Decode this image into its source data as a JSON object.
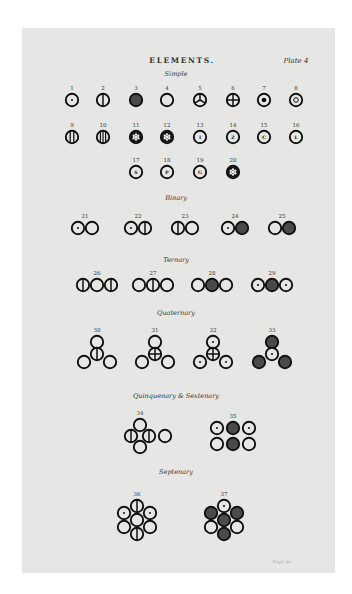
{
  "header": {
    "title": "ELEMENTS.",
    "plate": "Plate 4"
  },
  "sections": [
    {
      "id": "simple",
      "label": "Simple",
      "x": 176,
      "y": 76
    },
    {
      "id": "binary",
      "label": "Binary",
      "x": 176,
      "y": 200
    },
    {
      "id": "ternary",
      "label": "Ternary",
      "x": 176,
      "y": 262
    },
    {
      "id": "quaternary",
      "label": "Quaternary",
      "x": 176,
      "y": 315
    },
    {
      "id": "quinquenary-sextenary",
      "label": "Quinquenary & Sextenary",
      "x": 176,
      "y": 398
    },
    {
      "id": "septenary",
      "label": "Septenary",
      "x": 176,
      "y": 474
    }
  ],
  "signature": "Engd. &c",
  "colors": {
    "ink": "#111111",
    "fill_dark": "#4a4a4a",
    "paper": "#e6e6e4"
  },
  "symbols": [
    {
      "n": "1",
      "x": 72,
      "y": 100,
      "atoms": [
        {
          "dx": 0,
          "dy": 0,
          "t": "dot"
        }
      ]
    },
    {
      "n": "2",
      "x": 103,
      "y": 100,
      "atoms": [
        {
          "dx": 0,
          "dy": 0,
          "t": "vline"
        }
      ]
    },
    {
      "n": "3",
      "x": 136,
      "y": 100,
      "atoms": [
        {
          "dx": 0,
          "dy": 0,
          "t": "filled"
        }
      ]
    },
    {
      "n": "4",
      "x": 167,
      "y": 100,
      "atoms": [
        {
          "dx": 0,
          "dy": 0,
          "t": "plain"
        }
      ]
    },
    {
      "n": "5",
      "x": 200,
      "y": 100,
      "atoms": [
        {
          "dx": 0,
          "dy": 0,
          "t": "trisect"
        }
      ]
    },
    {
      "n": "6",
      "x": 233,
      "y": 100,
      "atoms": [
        {
          "dx": 0,
          "dy": 0,
          "t": "cross"
        }
      ]
    },
    {
      "n": "7",
      "x": 264,
      "y": 100,
      "atoms": [
        {
          "dx": 0,
          "dy": 0,
          "t": "bigdot"
        }
      ]
    },
    {
      "n": "8",
      "x": 296,
      "y": 100,
      "atoms": [
        {
          "dx": 0,
          "dy": 0,
          "t": "ring"
        }
      ]
    },
    {
      "n": "9",
      "x": 72,
      "y": 137,
      "atoms": [
        {
          "dx": 0,
          "dy": 0,
          "t": "vline2"
        }
      ]
    },
    {
      "n": "10",
      "x": 103,
      "y": 137,
      "atoms": [
        {
          "dx": 0,
          "dy": 0,
          "t": "vline3"
        }
      ]
    },
    {
      "n": "11",
      "x": 136,
      "y": 137,
      "atoms": [
        {
          "dx": 0,
          "dy": 0,
          "t": "star"
        }
      ]
    },
    {
      "n": "12",
      "x": 167,
      "y": 137,
      "atoms": [
        {
          "dx": 0,
          "dy": 0,
          "t": "star"
        }
      ]
    },
    {
      "n": "13",
      "x": 200,
      "y": 137,
      "atoms": [
        {
          "dx": 0,
          "dy": 0,
          "t": "letter",
          "l": "I"
        }
      ]
    },
    {
      "n": "14",
      "x": 233,
      "y": 137,
      "atoms": [
        {
          "dx": 0,
          "dy": 0,
          "t": "letter",
          "l": "Z"
        }
      ]
    },
    {
      "n": "15",
      "x": 264,
      "y": 137,
      "atoms": [
        {
          "dx": 0,
          "dy": 0,
          "t": "letter",
          "l": "C"
        }
      ]
    },
    {
      "n": "16",
      "x": 296,
      "y": 137,
      "atoms": [
        {
          "dx": 0,
          "dy": 0,
          "t": "letter",
          "l": "L"
        }
      ]
    },
    {
      "n": "17",
      "x": 136,
      "y": 172,
      "atoms": [
        {
          "dx": 0,
          "dy": 0,
          "t": "letter",
          "l": "S"
        }
      ]
    },
    {
      "n": "18",
      "x": 167,
      "y": 172,
      "atoms": [
        {
          "dx": 0,
          "dy": 0,
          "t": "letter",
          "l": "P"
        }
      ]
    },
    {
      "n": "19",
      "x": 200,
      "y": 172,
      "atoms": [
        {
          "dx": 0,
          "dy": 0,
          "t": "letter",
          "l": "G"
        }
      ]
    },
    {
      "n": "20",
      "x": 233,
      "y": 172,
      "atoms": [
        {
          "dx": 0,
          "dy": 0,
          "t": "star"
        }
      ]
    },
    {
      "n": "21",
      "x": 85,
      "y": 228,
      "atoms": [
        {
          "dx": -7,
          "dy": 0,
          "t": "dot"
        },
        {
          "dx": 7,
          "dy": 0,
          "t": "plain"
        }
      ]
    },
    {
      "n": "22",
      "x": 138,
      "y": 228,
      "atoms": [
        {
          "dx": -7,
          "dy": 0,
          "t": "dot"
        },
        {
          "dx": 7,
          "dy": 0,
          "t": "vline"
        }
      ]
    },
    {
      "n": "23",
      "x": 185,
      "y": 228,
      "atoms": [
        {
          "dx": -7,
          "dy": 0,
          "t": "vline"
        },
        {
          "dx": 7,
          "dy": 0,
          "t": "plain"
        }
      ]
    },
    {
      "n": "24",
      "x": 235,
      "y": 228,
      "atoms": [
        {
          "dx": -7,
          "dy": 0,
          "t": "dot"
        },
        {
          "dx": 7,
          "dy": 0,
          "t": "filled"
        }
      ]
    },
    {
      "n": "25",
      "x": 282,
      "y": 228,
      "atoms": [
        {
          "dx": -7,
          "dy": 0,
          "t": "plain"
        },
        {
          "dx": 7,
          "dy": 0,
          "t": "filled"
        }
      ]
    },
    {
      "n": "26",
      "x": 97,
      "y": 285,
      "atoms": [
        {
          "dx": -14,
          "dy": 0,
          "t": "vline"
        },
        {
          "dx": 0,
          "dy": 0,
          "t": "plain"
        },
        {
          "dx": 14,
          "dy": 0,
          "t": "vline"
        }
      ]
    },
    {
      "n": "27",
      "x": 153,
      "y": 285,
      "atoms": [
        {
          "dx": -14,
          "dy": 0,
          "t": "plain"
        },
        {
          "dx": 0,
          "dy": 0,
          "t": "vline"
        },
        {
          "dx": 14,
          "dy": 0,
          "t": "plain"
        }
      ]
    },
    {
      "n": "28",
      "x": 212,
      "y": 285,
      "atoms": [
        {
          "dx": -14,
          "dy": 0,
          "t": "plain"
        },
        {
          "dx": 0,
          "dy": 0,
          "t": "filled"
        },
        {
          "dx": 14,
          "dy": 0,
          "t": "plain"
        }
      ]
    },
    {
      "n": "29",
      "x": 272,
      "y": 285,
      "atoms": [
        {
          "dx": -14,
          "dy": 0,
          "t": "dot"
        },
        {
          "dx": 0,
          "dy": 0,
          "t": "filled"
        },
        {
          "dx": 14,
          "dy": 0,
          "t": "dot"
        }
      ]
    },
    {
      "n": "30",
      "x": 97,
      "y": 354,
      "atoms": [
        {
          "dx": 0,
          "dy": -12,
          "t": "plain"
        },
        {
          "dx": 0,
          "dy": 0,
          "t": "vline"
        },
        {
          "dx": -13,
          "dy": 8,
          "t": "plain"
        },
        {
          "dx": 13,
          "dy": 8,
          "t": "plain"
        }
      ]
    },
    {
      "n": "31",
      "x": 155,
      "y": 354,
      "atoms": [
        {
          "dx": 0,
          "dy": -12,
          "t": "plain"
        },
        {
          "dx": 0,
          "dy": 0,
          "t": "cross"
        },
        {
          "dx": -13,
          "dy": 8,
          "t": "plain"
        },
        {
          "dx": 13,
          "dy": 8,
          "t": "plain"
        }
      ]
    },
    {
      "n": "32",
      "x": 213,
      "y": 354,
      "atoms": [
        {
          "dx": 0,
          "dy": -12,
          "t": "dot"
        },
        {
          "dx": 0,
          "dy": 0,
          "t": "cross"
        },
        {
          "dx": -13,
          "dy": 8,
          "t": "dot"
        },
        {
          "dx": 13,
          "dy": 8,
          "t": "dot"
        }
      ]
    },
    {
      "n": "33",
      "x": 272,
      "y": 354,
      "atoms": [
        {
          "dx": 0,
          "dy": -12,
          "t": "filled"
        },
        {
          "dx": 0,
          "dy": 0,
          "t": "dot"
        },
        {
          "dx": -13,
          "dy": 8,
          "t": "filled"
        },
        {
          "dx": 13,
          "dy": 8,
          "t": "filled"
        }
      ]
    },
    {
      "n": "34",
      "x": 140,
      "y": 436,
      "atoms": [
        {
          "dx": 0,
          "dy": -11,
          "t": "plain"
        },
        {
          "dx": -9,
          "dy": 0,
          "t": "vline"
        },
        {
          "dx": 9,
          "dy": 0,
          "t": "vline"
        },
        {
          "dx": 0,
          "dy": 11,
          "t": "plain"
        },
        {
          "dx": 25,
          "dy": 0,
          "t": "plain"
        }
      ]
    },
    {
      "n": "35",
      "x": 233,
      "y": 436,
      "atoms": [
        {
          "dx": -16,
          "dy": -8,
          "t": "dot"
        },
        {
          "dx": 0,
          "dy": -8,
          "t": "filled"
        },
        {
          "dx": 16,
          "dy": -8,
          "t": "dot"
        },
        {
          "dx": -16,
          "dy": 8,
          "t": "plain"
        },
        {
          "dx": 0,
          "dy": 8,
          "t": "filled"
        },
        {
          "dx": 16,
          "dy": 8,
          "t": "plain"
        }
      ]
    },
    {
      "n": "36",
      "x": 137,
      "y": 520,
      "atoms": [
        {
          "dx": 0,
          "dy": -14,
          "t": "vline"
        },
        {
          "dx": -13,
          "dy": -7,
          "t": "dot"
        },
        {
          "dx": 13,
          "dy": -7,
          "t": "dot"
        },
        {
          "dx": 0,
          "dy": 0,
          "t": "plain"
        },
        {
          "dx": -13,
          "dy": 7,
          "t": "plain"
        },
        {
          "dx": 13,
          "dy": 7,
          "t": "plain"
        },
        {
          "dx": 0,
          "dy": 14,
          "t": "vline"
        }
      ]
    },
    {
      "n": "37",
      "x": 224,
      "y": 520,
      "atoms": [
        {
          "dx": 0,
          "dy": -14,
          "t": "dot"
        },
        {
          "dx": -13,
          "dy": -7,
          "t": "filled"
        },
        {
          "dx": 13,
          "dy": -7,
          "t": "filled"
        },
        {
          "dx": 0,
          "dy": 0,
          "t": "filled"
        },
        {
          "dx": -13,
          "dy": 7,
          "t": "plain"
        },
        {
          "dx": 13,
          "dy": 7,
          "t": "plain"
        },
        {
          "dx": 0,
          "dy": 14,
          "t": "filled"
        }
      ]
    }
  ],
  "number_label_offsets": {
    "1": 15,
    "2": 15,
    "3": 15,
    "4": 15,
    "5": 15,
    "6": 15,
    "7": 15,
    "8": 15,
    "9": 14,
    "10": 14,
    "11": 14,
    "12": 14,
    "13": 14,
    "14": 14,
    "15": 14,
    "16": 14,
    "17": 14,
    "18": 14,
    "19": 14,
    "20": 14,
    "21": 14,
    "22": 14,
    "23": 14,
    "24": 14,
    "25": 14,
    "26": 14,
    "27": 14,
    "28": 14,
    "29": 14,
    "30": 29,
    "31": 29,
    "32": 29,
    "33": 29,
    "34": 25,
    "35": 25,
    "36": 31,
    "37": 31
  }
}
